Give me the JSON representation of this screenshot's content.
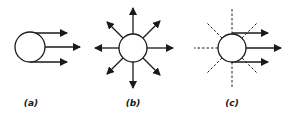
{
  "diagram": {
    "panels": [
      {
        "id": "a",
        "label": "(a)",
        "description": "circle with three parallel arrows pointing right"
      },
      {
        "id": "b",
        "label": "(b)",
        "description": "circle with eight arrows radiating outward in all directions"
      },
      {
        "id": "c",
        "label": "(c)",
        "description": "circle with dashed radial lines and three parallel arrows pointing right"
      }
    ]
  }
}
